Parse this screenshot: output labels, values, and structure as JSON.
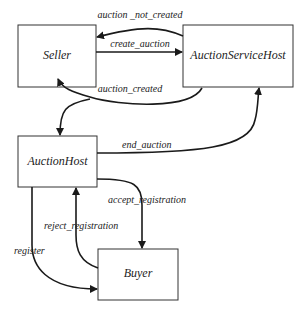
{
  "diagram": {
    "nodes": [
      {
        "id": "seller",
        "label": "Seller"
      },
      {
        "id": "auction_service_host",
        "label": "AuctionServiceHost"
      },
      {
        "id": "auction_host",
        "label": "AuctionHost"
      },
      {
        "id": "buyer",
        "label": "Buyer"
      }
    ],
    "edges": [
      {
        "id": "auction_not_created",
        "label": "auction _not_created",
        "from": "auction_service_host",
        "to": "seller"
      },
      {
        "id": "create_auction",
        "label": "create_auction",
        "from": "seller",
        "to": "auction_service_host"
      },
      {
        "id": "auction_created",
        "label": "auction_created",
        "from": "auction_service_host",
        "to": "seller"
      },
      {
        "id": "spawn_auction_host",
        "label": "",
        "from": "auction_created",
        "to": "auction_host"
      },
      {
        "id": "end_auction",
        "label": "end_auction",
        "from": "auction_host",
        "to": "auction_service_host"
      },
      {
        "id": "accept_registration",
        "label": "accept_registration",
        "from": "auction_host",
        "to": "buyer"
      },
      {
        "id": "reject_registration",
        "label": "reject_registration",
        "from": "buyer",
        "to": "auction_host"
      },
      {
        "id": "register",
        "label": "register",
        "from": "auction_host",
        "to": "buyer"
      }
    ]
  }
}
